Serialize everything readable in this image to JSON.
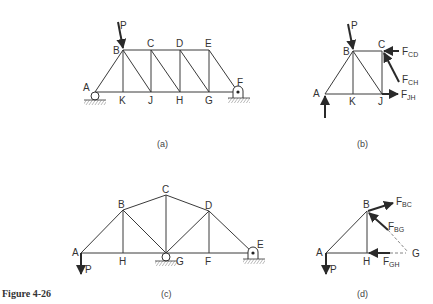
{
  "figure": {
    "title": "Figure 4-26",
    "panels": [
      {
        "id": "a",
        "caption": "(a)",
        "description": "Parallel-chord truss with roller at A and pin at F, load P at joint B",
        "joints": {
          "A": [
            95,
            92
          ],
          "B": [
            123,
            50
          ],
          "C": [
            151,
            50
          ],
          "D": [
            180,
            50
          ],
          "E": [
            209,
            50
          ],
          "F": [
            238,
            92
          ],
          "K": [
            123,
            92
          ],
          "J": [
            151,
            92
          ],
          "H": [
            180,
            92
          ],
          "G": [
            209,
            92
          ]
        },
        "members": [
          [
            "A",
            "B"
          ],
          [
            "B",
            "C"
          ],
          [
            "C",
            "D"
          ],
          [
            "D",
            "E"
          ],
          [
            "E",
            "F"
          ],
          [
            "A",
            "K"
          ],
          [
            "K",
            "J"
          ],
          [
            "J",
            "H"
          ],
          [
            "H",
            "G"
          ],
          [
            "G",
            "F"
          ],
          [
            "B",
            "K"
          ],
          [
            "B",
            "J"
          ],
          [
            "C",
            "J"
          ],
          [
            "C",
            "H"
          ],
          [
            "D",
            "H"
          ],
          [
            "D",
            "G"
          ],
          [
            "E",
            "G"
          ]
        ],
        "supports": {
          "roller": "A",
          "pin": "F"
        },
        "loads": [
          {
            "label": "P",
            "at": "B"
          }
        ]
      },
      {
        "id": "b",
        "caption": "(b)",
        "description": "Free body of left section cut through CD, CH, JH",
        "joints": {
          "A": [
            325,
            94
          ],
          "B": [
            353,
            51
          ],
          "C": [
            382,
            51
          ],
          "K": [
            353,
            94
          ],
          "J": [
            382,
            94
          ]
        },
        "members": [
          [
            "A",
            "B"
          ],
          [
            "B",
            "C"
          ],
          [
            "A",
            "K"
          ],
          [
            "K",
            "J"
          ],
          [
            "B",
            "K"
          ],
          [
            "B",
            "J"
          ],
          [
            "C",
            "J"
          ]
        ],
        "forces": [
          {
            "label": "P",
            "sub": ""
          },
          {
            "label": "F",
            "sub": "CD"
          },
          {
            "label": "F",
            "sub": "CH"
          },
          {
            "label": "F",
            "sub": "JH"
          }
        ]
      },
      {
        "id": "c",
        "caption": "(c)",
        "description": "Roof truss with roller at G and pin at E, load P downward at A",
        "joints": {
          "A": [
            81,
            253
          ],
          "B": [
            123,
            210
          ],
          "C": [
            166,
            195
          ],
          "D": [
            209,
            211
          ],
          "E": [
            253,
            253
          ],
          "H": [
            123,
            253
          ],
          "G": [
            166,
            253
          ],
          "F": [
            209,
            253
          ]
        },
        "members": [
          [
            "A",
            "B"
          ],
          [
            "B",
            "C"
          ],
          [
            "C",
            "D"
          ],
          [
            "D",
            "E"
          ],
          [
            "A",
            "H"
          ],
          [
            "H",
            "G"
          ],
          [
            "G",
            "F"
          ],
          [
            "F",
            "E"
          ],
          [
            "B",
            "H"
          ],
          [
            "B",
            "G"
          ],
          [
            "C",
            "G"
          ],
          [
            "D",
            "G"
          ],
          [
            "D",
            "F"
          ]
        ],
        "supports": {
          "roller": "G",
          "pin": "E"
        },
        "loads": [
          {
            "label": "P",
            "at": "A"
          }
        ]
      },
      {
        "id": "d",
        "caption": "(d)",
        "description": "Free body of left section cut through BC, BG, GH",
        "joints": {
          "A": [
            326,
            253
          ],
          "B": [
            367,
            211
          ],
          "H": [
            367,
            253
          ],
          "G": [
            409,
            253
          ]
        },
        "members": [
          [
            "A",
            "B"
          ],
          [
            "A",
            "H"
          ],
          [
            "B",
            "H"
          ]
        ],
        "forces": [
          {
            "label": "P",
            "sub": ""
          },
          {
            "label": "F",
            "sub": "BC"
          },
          {
            "label": "F",
            "sub": "BG"
          },
          {
            "label": "F",
            "sub": "GH"
          }
        ]
      }
    ]
  },
  "labels": {
    "a": {
      "A": "A",
      "B": "B",
      "C": "C",
      "D": "D",
      "E": "E",
      "F": "F",
      "K": "K",
      "J": "J",
      "H": "H",
      "G": "G",
      "P": "P"
    },
    "b": {
      "A": "A",
      "B": "B",
      "C": "C",
      "K": "K",
      "J": "J",
      "P": "P",
      "FCD": "F",
      "FCD_sub": "CD",
      "FCH": "F",
      "FCH_sub": "CH",
      "FJH": "F",
      "FJH_sub": "JH"
    },
    "c": {
      "A": "A",
      "B": "B",
      "C": "C",
      "D": "D",
      "E": "E",
      "H": "H",
      "G": "G",
      "F": "F",
      "P": "P"
    },
    "d": {
      "A": "A",
      "B": "B",
      "H": "H",
      "G": "G",
      "P": "P",
      "FBC": "F",
      "FBC_sub": "BC",
      "FBG": "F",
      "FBG_sub": "BG",
      "FGH": "F",
      "FGH_sub": "GH"
    }
  },
  "captions": {
    "a": "(a)",
    "b": "(b)",
    "c": "(c)",
    "d": "(d)",
    "figure": "Figure 4-26"
  }
}
